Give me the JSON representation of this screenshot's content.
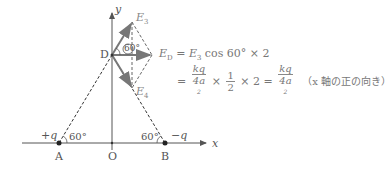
{
  "diagram": {
    "axes": {
      "x_label": "x",
      "y_label": "y",
      "origin_label": "O"
    },
    "points": {
      "A": {
        "label": "A",
        "charge": "+q",
        "angle": "60°"
      },
      "B": {
        "label": "B",
        "charge": "−q",
        "angle": "60°"
      },
      "D": {
        "label": "D",
        "angle": "60°"
      }
    },
    "vectors": {
      "E3": "E",
      "E3_sub": "3",
      "E4": "E",
      "E4_sub": "4",
      "ED": "E",
      "ED_sub": "D"
    },
    "colors": {
      "arrow": "#777777",
      "axis": "#555555",
      "dashed": "#333333"
    }
  },
  "equation": {
    "line1_lhs_sub": "D",
    "line1_rhs": "E",
    "line1_rhs_sub": "3",
    "line1_tail": " cos 60° × 2",
    "line2_eq": "=",
    "frac1_num": "kq",
    "frac1_den": "4a",
    "times_half": "×",
    "half_num": "1",
    "half_den": "2",
    "times_two": "× 2 =",
    "frac2_num": "kq",
    "frac2_den": "4a",
    "note": "（x 軸の正の向き）"
  }
}
